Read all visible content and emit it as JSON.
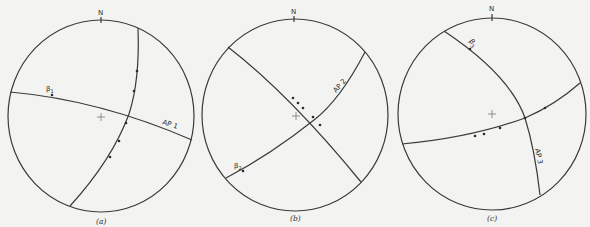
{
  "figure": {
    "type": "stereonet-set",
    "panels": [
      {
        "id": "a",
        "caption": "(a)",
        "north_label": "N",
        "beta_label": "β",
        "beta_sub": "1",
        "axial_plane_label": "AP 1"
      },
      {
        "id": "b",
        "caption": "(b)",
        "north_label": "N",
        "beta_label": "β",
        "beta_sub": "2",
        "axial_plane_label": "AP 2"
      },
      {
        "id": "c",
        "caption": "(c)",
        "north_label": "N",
        "beta_label": "β",
        "beta_sub": "3",
        "axial_plane_label": "AP 3"
      }
    ]
  },
  "colors": {
    "background": "#f3f3f1",
    "line": "#3a3a3a",
    "dot": "#2a2a2a"
  }
}
